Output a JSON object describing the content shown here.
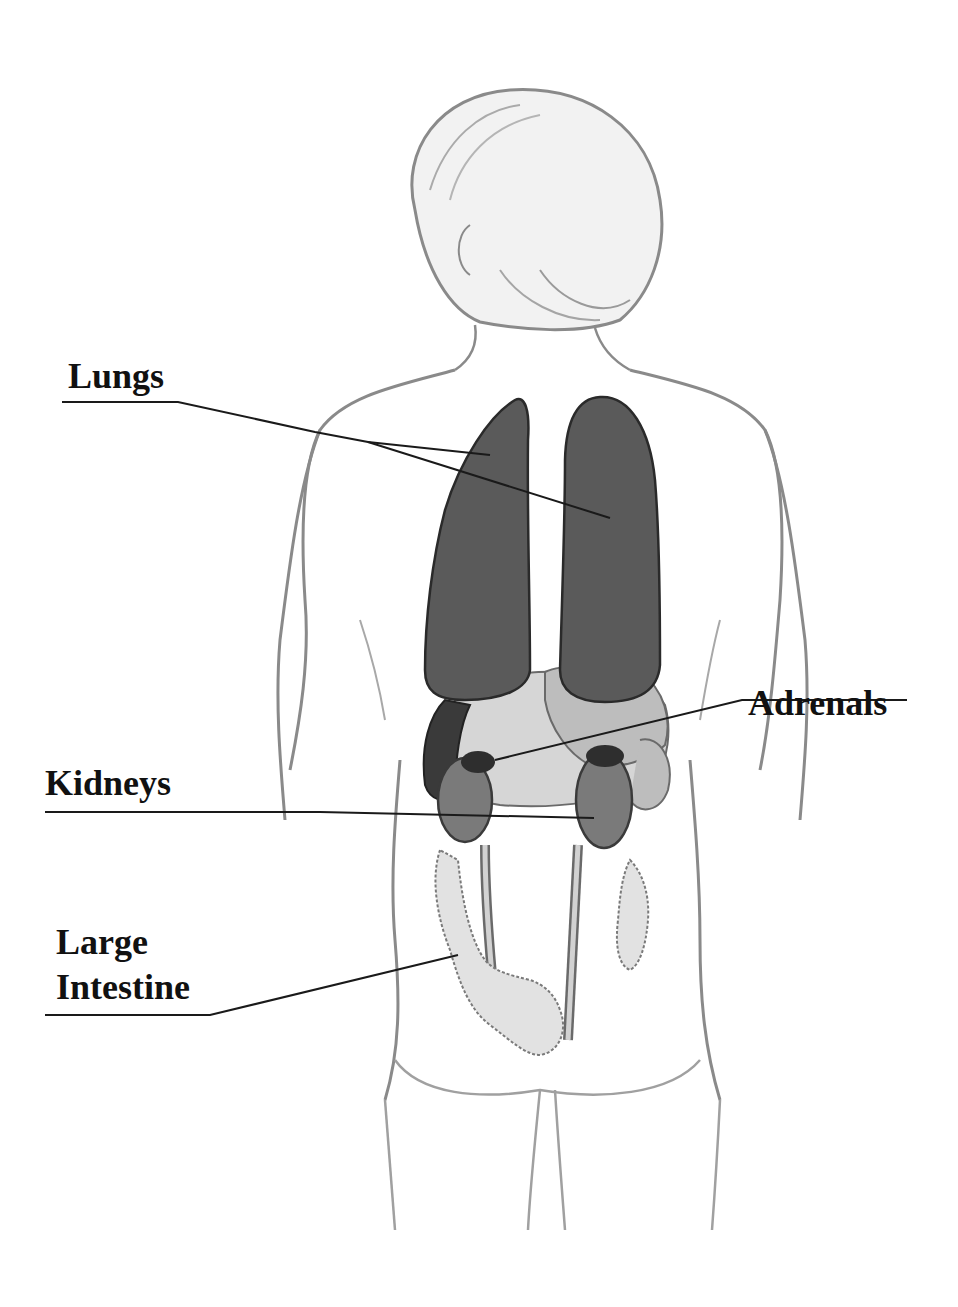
{
  "diagram": {
    "type": "anatomical-illustration",
    "labels": [
      {
        "id": "lungs",
        "text": "Lungs"
      },
      {
        "id": "adrenals",
        "text": "Adrenals"
      },
      {
        "id": "kidneys",
        "text": "Kidneys"
      },
      {
        "id": "large_intestine",
        "line1": "Large",
        "line2": "Intestine"
      }
    ],
    "colors": {
      "background": "#ffffff",
      "outline": "#8a8a8a",
      "outline_dark": "#3a3a3a",
      "lungs": "#5a5a5a",
      "adrenals": "#2e2e2e",
      "kidneys": "#7a7a7a",
      "liver_spleen": "#bdbdbd",
      "stomach": "#d6d6d6",
      "intestine": "#e2e2e2",
      "ureter": "#c8c8c8",
      "label_text": "#111111",
      "leader_line": "#1a1a1a"
    }
  }
}
